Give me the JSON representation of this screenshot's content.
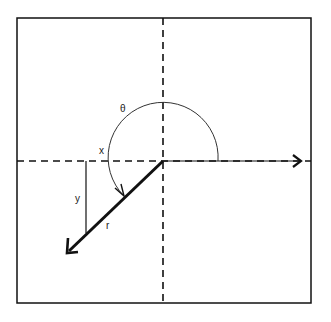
{
  "diagram": {
    "type": "polar-coordinates",
    "labels": {
      "theta": "θ",
      "x": "x",
      "y": "y",
      "r": "r"
    },
    "colors": {
      "background": "#ffffff",
      "stroke": "#111111",
      "text": "#222222"
    }
  }
}
